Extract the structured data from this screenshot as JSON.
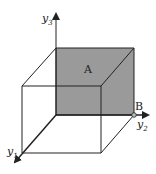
{
  "diagram": {
    "type": "3d-cube-coordinate-axes",
    "axes": [
      {
        "name": "y1",
        "base": "y",
        "sub": "1",
        "direction": "toward-viewer-lower-left"
      },
      {
        "name": "y2",
        "base": "y",
        "sub": "2",
        "direction": "right"
      },
      {
        "name": "y3",
        "base": "y",
        "sub": "3",
        "direction": "up"
      }
    ],
    "labels": {
      "face": "A",
      "point": "B"
    },
    "colors": {
      "shaded_face": "#9a9a9a",
      "lines": "#222222",
      "background": "#ffffff"
    }
  }
}
